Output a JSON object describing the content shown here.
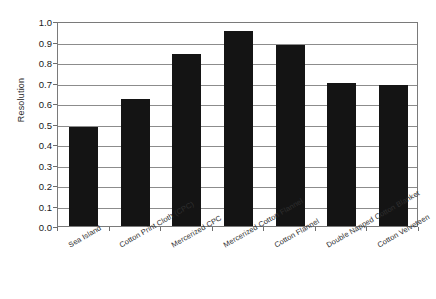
{
  "chart_data": {
    "type": "bar",
    "title": "",
    "xlabel": "",
    "ylabel": "Resolution",
    "ylim": [
      0.0,
      1.0
    ],
    "ytick_labels": [
      "1.0",
      "0.9",
      "0.8",
      "0.7",
      "0.6",
      "0.5",
      "0.4",
      "0.3",
      "0.2",
      "0.1",
      "0.0"
    ],
    "ytick_values": [
      1.0,
      0.9,
      0.8,
      0.7,
      0.6,
      0.5,
      0.4,
      0.3,
      0.2,
      0.1,
      0.0
    ],
    "grid": "horizontal",
    "legend": "none",
    "bar_color": "#141414",
    "categories": [
      "Sea Island",
      "Cotton Print Cloth (CPC)",
      "Mercerized CPC",
      "Mercerized Cotton Flannel",
      "Cotton Flannel",
      "Double Napped Cotton Blanket",
      "Cotton Velveteen"
    ],
    "values": [
      0.485,
      0.62,
      0.84,
      0.95,
      0.885,
      0.7,
      0.69
    ],
    "series": [
      {
        "name": "Resolution",
        "values": [
          0.485,
          0.62,
          0.84,
          0.95,
          0.885,
          0.7,
          0.69
        ]
      }
    ]
  }
}
